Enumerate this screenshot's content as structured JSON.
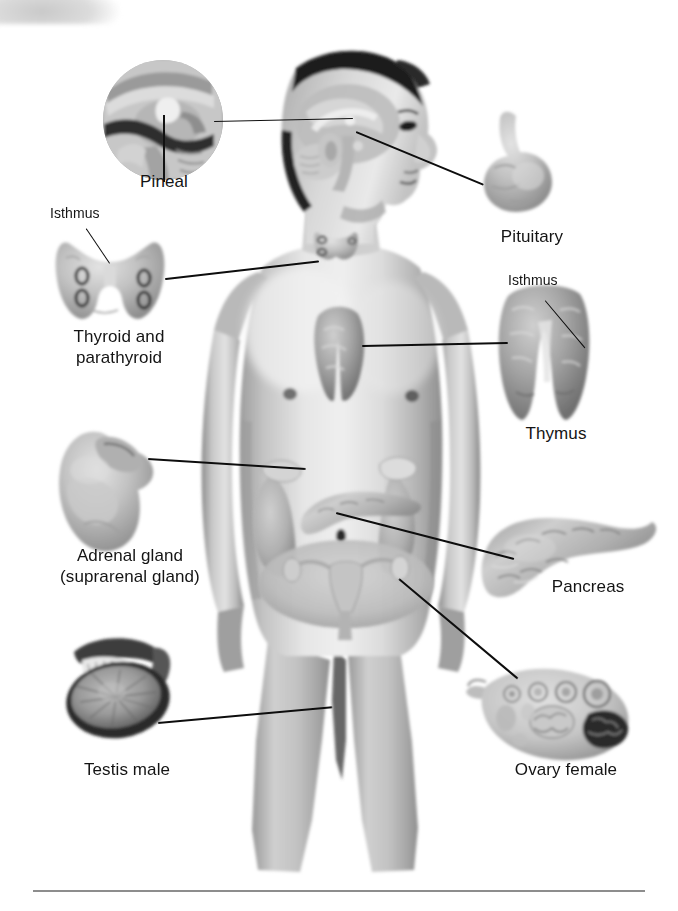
{
  "figure": {
    "background_color": "#ffffff",
    "line_color": "#0d0d0d",
    "text_color": "#141414"
  },
  "labels": {
    "pineal": "Pineal",
    "isthmus_thyroid": "Isthmus",
    "thyroid_parathyroid_line1": "Thyroid and",
    "thyroid_parathyroid_line2": "parathyroid",
    "adrenal_line1": "Adrenal gland",
    "adrenal_line2": "(suprarenal gland)",
    "testis": "Testis male",
    "pituitary": "Pituitary",
    "isthmus_thymus": "Isthmus",
    "thymus": "Thymus",
    "pancreas": "Pancreas",
    "ovary": "Ovary female"
  },
  "callouts": [
    {
      "name": "pineal",
      "label": "Pineal",
      "side": "left",
      "inset": "circular-inset-brain-midsagittal"
    },
    {
      "name": "thyroid-parathyroid",
      "label": "Thyroid and parathyroid",
      "side": "left",
      "sublabel": "Isthmus"
    },
    {
      "name": "adrenal-gland",
      "label": "Adrenal gland (suprarenal gland)",
      "side": "left"
    },
    {
      "name": "testis",
      "label": "Testis male",
      "side": "left"
    },
    {
      "name": "pituitary",
      "label": "Pituitary",
      "side": "right"
    },
    {
      "name": "thymus",
      "label": "Thymus",
      "side": "right",
      "sublabel": "Isthmus"
    },
    {
      "name": "pancreas",
      "label": "Pancreas",
      "side": "right"
    },
    {
      "name": "ovary",
      "label": "Ovary female",
      "side": "right"
    }
  ]
}
